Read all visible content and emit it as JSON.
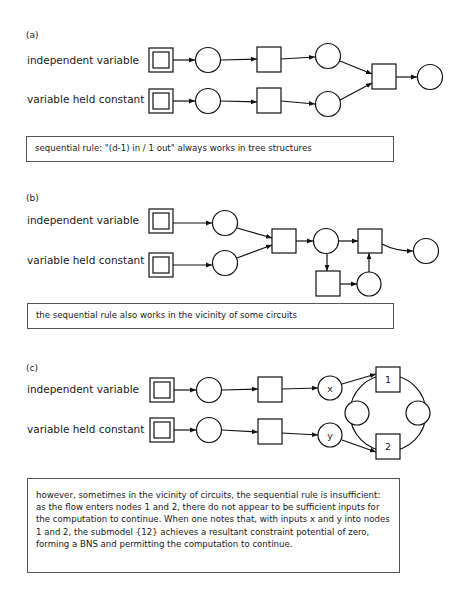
{
  "panels": [
    {
      "id": "a",
      "label": "(a)",
      "rows": [
        "independent variable",
        "variable held constant"
      ],
      "caption": "sequential rule: \"(d-1) in / 1 out\" always works in tree structures"
    },
    {
      "id": "b",
      "label": "(b)",
      "rows": [
        "independent variable",
        "variable held constant"
      ],
      "caption": "the sequential rule also works in the vicinity of some circuits"
    },
    {
      "id": "c",
      "label": "(c)",
      "rows": [
        "independent variable",
        "variable held constant"
      ],
      "node_labels": {
        "x": "x",
        "y": "y",
        "node1": "1",
        "node2": "2"
      },
      "caption": "however, sometimes in the vicinity of circuits, the sequential rule is insufficient: as the flow enters nodes 1 and 2, there do not appear to be sufficient inputs for the computation to continue. When one notes that, with inputs x and y into nodes 1 and 2, the submodel {12} achieves a resultant constraint potential of zero, forming a BNS and permitting the computation to continue."
    }
  ],
  "legend_semantics": {
    "double-square": "input node",
    "square": "constraint node",
    "circle": "variable node"
  },
  "colors": {
    "stroke": "#111111",
    "caption_border": "#555555"
  }
}
